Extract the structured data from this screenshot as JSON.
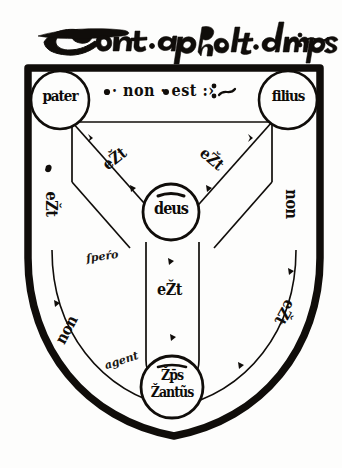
{
  "document": {
    "kind": "manuscript-diagram",
    "name": "Scutum Fidei",
    "title_line": "Sont·apholt·dympo:~",
    "ink_color": "#100d0a",
    "parchment_color": "#fdfdfc"
  },
  "heading": {
    "text": "Sont·apholt·dympo:~",
    "script": "gothic-cursive"
  },
  "shield": {
    "outline_color": "#100d0a",
    "top_left_x": 28,
    "top_right_x": 320,
    "top_y": 68,
    "point_y": 436
  },
  "nodes": [
    {
      "id": "pater",
      "label": "pater",
      "position": "top-left",
      "cx": 60,
      "cy": 100,
      "r": 29
    },
    {
      "id": "filius",
      "label": "filius",
      "position": "top-right",
      "cx": 288,
      "cy": 100,
      "r": 29
    },
    {
      "id": "deus",
      "label": "deus",
      "position": "center",
      "cx": 171,
      "cy": 212,
      "r": 28
    },
    {
      "id": "sps",
      "label_line1": "Žp̄s",
      "label_line2": "Žantũs",
      "label": "Žp̄s Žantũs",
      "position": "bottom",
      "cx": 172,
      "cy": 387,
      "r": 31
    }
  ],
  "edges": [
    {
      "id": "pater-filius",
      "label": "· non · est :›",
      "placement": "top-horizontal",
      "x": 108,
      "y": 85,
      "rotate": 0
    },
    {
      "id": "pater-deus",
      "label": "eŽt",
      "placement": "upper-left-arm",
      "x": 102,
      "y": 151,
      "rotate": -38
    },
    {
      "id": "filius-deus",
      "label": "eŽt",
      "placement": "upper-right-arm",
      "x": 199,
      "y": 151,
      "rotate": 40
    },
    {
      "id": "deus-sps",
      "label": "eŽt",
      "placement": "lower-stem",
      "x": 157,
      "y": 282,
      "rotate": 0
    },
    {
      "id": "pater-sps",
      "label": "non",
      "placement": "lower-left-border",
      "x": 62,
      "y": 327,
      "rotate": -62
    },
    {
      "id": "filius-right-1",
      "label": "non",
      "placement": "right-border-upper",
      "x": 286,
      "y": 200,
      "rotate": 90
    },
    {
      "id": "filius-sps",
      "label": "eŽt",
      "placement": "lower-right-border",
      "x": 281,
      "y": 308,
      "rotate": 118
    },
    {
      "id": "pater-left-1",
      "label": "eŽt",
      "placement": "left-border-upper",
      "x": 48,
      "y": 200,
      "rotate": 90
    }
  ],
  "marginalia": [
    {
      "id": "note-mid-left",
      "text": "ſpeŕo",
      "x": 86,
      "y": 256,
      "rotate": -8
    },
    {
      "id": "note-lower-left",
      "text": "agent",
      "x": 108,
      "y": 360,
      "rotate": -18
    }
  ],
  "flourishes": [
    {
      "id": "dot-top-left",
      "x": 107,
      "y": 92
    },
    {
      "id": "dot-top-mid",
      "x": 165,
      "y": 92
    },
    {
      "id": "colon-top-right",
      "x": 216,
      "y": 92
    },
    {
      "id": "tick-inner-left",
      "x": 90,
      "y": 139
    },
    {
      "id": "tick-inner-right",
      "x": 247,
      "y": 139
    },
    {
      "id": "tick-left-edge",
      "x": 49,
      "y": 170
    },
    {
      "id": "tick-mid-left",
      "x": 133,
      "y": 188
    },
    {
      "id": "tick-mid-right",
      "x": 208,
      "y": 188
    },
    {
      "id": "tick-stem-top",
      "x": 170,
      "y": 262
    },
    {
      "id": "tick-stem-bot",
      "x": 172,
      "y": 337
    },
    {
      "id": "tick-lowleft",
      "x": 56,
      "y": 303
    },
    {
      "id": "tick-lowright",
      "x": 290,
      "y": 272
    },
    {
      "id": "tick-lowright2",
      "x": 240,
      "y": 365
    }
  ]
}
